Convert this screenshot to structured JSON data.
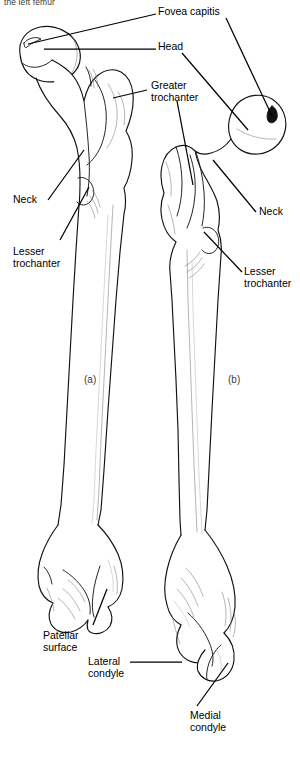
{
  "figure": {
    "caption_top": "the left femur",
    "panels": [
      {
        "id": "a",
        "letter": "(a)",
        "view": "anterior"
      },
      {
        "id": "b",
        "letter": "(b)",
        "view": "posterior"
      }
    ]
  },
  "labels": [
    {
      "key": "fovea_capitis",
      "text": "Fovea capitis",
      "side": "right"
    },
    {
      "key": "head",
      "text": "Head",
      "side": "right"
    },
    {
      "key": "greater_trochanter",
      "text": "Greater\ntrochanter",
      "side": "right"
    },
    {
      "key": "neck_a",
      "text": "Neck",
      "side": "left"
    },
    {
      "key": "lesser_trochanter_a",
      "text": "Lesser\ntrochanter",
      "side": "left"
    },
    {
      "key": "neck_b",
      "text": "Neck",
      "side": "right"
    },
    {
      "key": "lesser_trochanter_b",
      "text": "Lesser\ntrochanter",
      "side": "right"
    },
    {
      "key": "patellar_surface",
      "text": "Patellar\nsurface",
      "side": "left"
    },
    {
      "key": "lateral_condyle",
      "text": "Lateral\ncondyle",
      "side": "left"
    },
    {
      "key": "medial_condyle",
      "text": "Medial\ncondyle",
      "side": "bottom"
    }
  ],
  "colors": {
    "ink": "#111111",
    "shade": "#777777",
    "paper": "#ffffff",
    "caption": "#3a3a3a"
  }
}
